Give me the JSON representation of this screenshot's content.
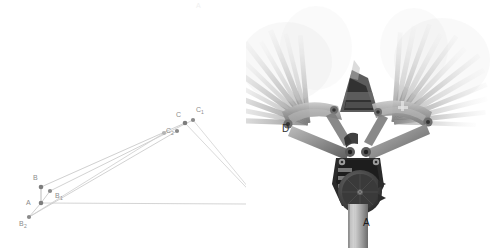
{
  "figure": {
    "background_color": "#ffffff",
    "width": 492,
    "height": 248,
    "faint_top_mark": "A"
  },
  "diagram": {
    "name": "kinematic-linkage-diagram",
    "line_color": "#bcbcbc",
    "point_color": "#7d7d7d",
    "label_color": "#8c8c8c",
    "points": [
      {
        "id": "A",
        "label": "A",
        "sub": "",
        "x": 41,
        "y": 203,
        "label_x": 26,
        "label_y": 205
      },
      {
        "id": "B",
        "label": "B",
        "sub": "",
        "x": 41,
        "y": 187,
        "label_x": 33,
        "label_y": 180
      },
      {
        "id": "B1",
        "label": "B",
        "sub": "1",
        "x": 50,
        "y": 191,
        "label_x": 55,
        "label_y": 198
      },
      {
        "id": "B2",
        "label": "B",
        "sub": "2",
        "x": 29,
        "y": 217,
        "label_x": 19,
        "label_y": 226
      },
      {
        "id": "C",
        "label": "C",
        "sub": "",
        "x": 185,
        "y": 123,
        "label_x": 176,
        "label_y": 117
      },
      {
        "id": "C1",
        "label": "C",
        "sub": "1",
        "x": 193,
        "y": 120,
        "label_x": 196,
        "label_y": 112
      },
      {
        "id": "C2",
        "label": "C",
        "sub": "2",
        "x": 164,
        "y": 133,
        "label_x": 167,
        "label_y": 133
      },
      {
        "id": "C3",
        "label": "",
        "sub": "",
        "x": 177,
        "y": 131,
        "label_x": 0,
        "label_y": 0
      },
      {
        "id": "D",
        "label": "D",
        "sub": "",
        "x": 262,
        "y": 204,
        "label_x": 266,
        "label_y": 214
      }
    ],
    "links": [
      {
        "name": "link-A-B",
        "from": "A",
        "to": "B"
      },
      {
        "name": "link-A-B1",
        "from": "A",
        "to": "B1"
      },
      {
        "name": "link-A-B2",
        "from": "A",
        "to": "B2"
      },
      {
        "name": "link-B-C",
        "from": "B",
        "to": "C"
      },
      {
        "name": "link-B1-C1",
        "from": "B1",
        "to": "C1"
      },
      {
        "name": "link-B2-C3",
        "from": "B2",
        "to": "C3"
      },
      {
        "name": "link-C-D",
        "from": "C",
        "to": "D"
      },
      {
        "name": "link-C1-D",
        "from": "C1",
        "to": "D"
      },
      {
        "name": "link-A-D",
        "from": "A",
        "to": "D"
      }
    ],
    "coupler_rays": [
      {
        "name": "coupler-ray-C2",
        "from": "C2",
        "to": "B2"
      }
    ]
  },
  "photo": {
    "name": "wiper-mechanism-multi-exposure-photo",
    "caption_labels": [
      {
        "id": "photo-label-D",
        "text": "D",
        "x": 40,
        "y": 128
      },
      {
        "id": "photo-label-A",
        "text": "A",
        "x": 121,
        "y": 222
      }
    ],
    "description_tone": "grayscale",
    "blade_count_left": 11,
    "blade_count_right": 12
  }
}
